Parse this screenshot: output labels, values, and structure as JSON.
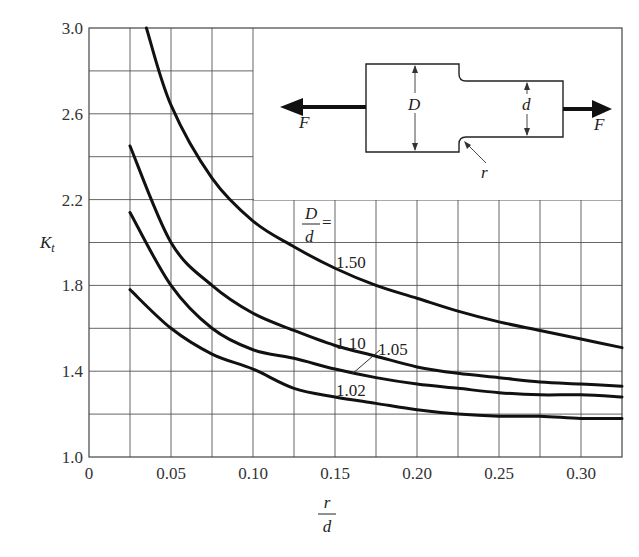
{
  "chart_data": {
    "type": "line",
    "title": "",
    "xlabel": "r/d",
    "ylabel": "K_t",
    "xlim": [
      0,
      0.325
    ],
    "ylim": [
      1.0,
      3.0
    ],
    "grid": true,
    "x_ticks": [
      "0",
      "0.05",
      "0.10",
      "0.15",
      "0.20",
      "0.25",
      "0.30"
    ],
    "y_ticks": [
      "1.0",
      "1.4",
      "1.8",
      "2.2",
      "2.6",
      "3.0"
    ],
    "legend_title": "D/d =",
    "series": [
      {
        "name": "1.50",
        "x": [
          0.035,
          0.05,
          0.075,
          0.1,
          0.125,
          0.15,
          0.175,
          0.2,
          0.225,
          0.25,
          0.275,
          0.3,
          0.325
        ],
        "y": [
          3.0,
          2.64,
          2.3,
          2.1,
          1.98,
          1.88,
          1.8,
          1.74,
          1.68,
          1.63,
          1.59,
          1.55,
          1.51
        ]
      },
      {
        "name": "1.10",
        "x": [
          0.025,
          0.05,
          0.075,
          0.1,
          0.125,
          0.15,
          0.175,
          0.2,
          0.225,
          0.25,
          0.275,
          0.3,
          0.325
        ],
        "y": [
          2.45,
          2.0,
          1.8,
          1.67,
          1.59,
          1.52,
          1.47,
          1.42,
          1.39,
          1.37,
          1.35,
          1.34,
          1.33
        ]
      },
      {
        "name": "1.05",
        "x": [
          0.025,
          0.05,
          0.075,
          0.1,
          0.125,
          0.15,
          0.175,
          0.2,
          0.225,
          0.25,
          0.275,
          0.3,
          0.325
        ],
        "y": [
          2.14,
          1.8,
          1.6,
          1.5,
          1.46,
          1.41,
          1.37,
          1.34,
          1.32,
          1.3,
          1.29,
          1.29,
          1.28
        ]
      },
      {
        "name": "1.02",
        "x": [
          0.025,
          0.05,
          0.075,
          0.1,
          0.125,
          0.15,
          0.175,
          0.2,
          0.225,
          0.25,
          0.275,
          0.3,
          0.325
        ],
        "y": [
          1.78,
          1.6,
          1.48,
          1.41,
          1.32,
          1.28,
          1.25,
          1.22,
          1.2,
          1.19,
          1.19,
          1.18,
          1.18
        ]
      }
    ],
    "annotations": [
      {
        "text": "1.50",
        "at_series": "1.50"
      },
      {
        "text": "1.10",
        "at_series": "1.10"
      },
      {
        "text": "1.05",
        "at_series": "1.05",
        "leader_line": true
      },
      {
        "text": "1.02",
        "at_series": "1.02"
      }
    ],
    "inset_diagram": {
      "description": "Stepped flat bar in tension with shoulder fillet",
      "labels": {
        "force_left": "F",
        "force_right": "F",
        "large_dim": "D",
        "small_dim": "d",
        "fillet": "r"
      }
    }
  },
  "axes": {
    "xlabel_num": "r",
    "xlabel_den": "d",
    "ylabel_main": "K",
    "ylabel_sub": "t"
  },
  "legend": {
    "num": "D",
    "den": "d",
    "eq": "="
  },
  "diagram": {
    "F_left": "F",
    "F_right": "F",
    "D": "D",
    "d": "d",
    "r": "r"
  }
}
